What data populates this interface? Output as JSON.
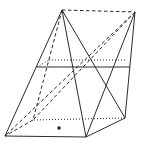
{
  "figure": {
    "canvas": {
      "width": 141,
      "height": 148
    },
    "background_color": "#ffffff",
    "stroke_color": "#2b2b2b",
    "stroke_width": 1,
    "vertices": {
      "apex_left_P": [
        62,
        10
      ],
      "apex_right_Q": [
        135,
        12
      ],
      "base_front_left_A": [
        5,
        136
      ],
      "base_front_right_B": [
        86,
        137
      ],
      "base_back_right_C": [
        125,
        118
      ],
      "base_back_left_D": [
        33,
        120
      ],
      "section_front_left": [
        37,
        67
      ],
      "section_front_right": [
        130,
        67
      ],
      "section_back_left": [
        49,
        60
      ],
      "section_back_right": [
        127,
        60
      ]
    },
    "edges": [
      {
        "name": "edge-P-A",
        "from": "apex_left_P",
        "to": "base_front_left_A",
        "style": "solid"
      },
      {
        "name": "edge-P-B",
        "from": "apex_left_P",
        "to": "base_front_right_B",
        "style": "solid"
      },
      {
        "name": "edge-P-C",
        "from": "apex_left_P",
        "to": "base_back_right_C",
        "style": "solid"
      },
      {
        "name": "edge-P-D",
        "from": "apex_left_P",
        "to": "base_back_left_D",
        "style": "dashed"
      },
      {
        "name": "edge-P-Q",
        "from": "apex_left_P",
        "to": "apex_right_Q",
        "style": "dashed"
      },
      {
        "name": "edge-Q-A",
        "from": "apex_right_Q",
        "to": "base_front_left_A",
        "style": "dashed"
      },
      {
        "name": "edge-Q-B",
        "from": "apex_right_Q",
        "to": "base_front_right_B",
        "style": "solid"
      },
      {
        "name": "edge-Q-C",
        "from": "apex_right_Q",
        "to": "base_back_right_C",
        "style": "solid"
      },
      {
        "name": "edge-Q-D",
        "from": "apex_right_Q",
        "to": "base_back_left_D",
        "style": "dashed"
      },
      {
        "name": "edge-A-B",
        "from": "base_front_left_A",
        "to": "base_front_right_B",
        "style": "solid"
      },
      {
        "name": "edge-B-C",
        "from": "base_front_right_B",
        "to": "base_back_right_C",
        "style": "solid"
      },
      {
        "name": "edge-C-D",
        "from": "base_back_right_C",
        "to": "base_back_left_D",
        "style": "dotted"
      },
      {
        "name": "edge-D-A",
        "from": "base_back_left_D",
        "to": "base_front_left_A",
        "style": "dashed"
      },
      {
        "name": "section-front-trace",
        "from": "section_front_left",
        "to": "section_front_right",
        "style": "solid"
      },
      {
        "name": "section-back-trace",
        "from": "section_back_left",
        "to": "section_back_right",
        "style": "dotted"
      },
      {
        "name": "section-left-end",
        "from": "section_front_left",
        "to": "section_back_left",
        "style": "dotted"
      }
    ],
    "dash_patterns": {
      "solid": "",
      "dashed": "3.5,2.5",
      "dotted": "1,2"
    },
    "point_marker": {
      "name": "base-center-point",
      "x": 59,
      "y": 128,
      "size": 3,
      "shape": "square",
      "color": "#1a1a1a"
    }
  }
}
